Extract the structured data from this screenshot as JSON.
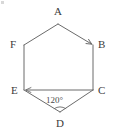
{
  "figure": {
    "type": "geometry-diagram",
    "shape_name": "hexagon",
    "stroke_color": "#6b6b6b",
    "label_color": "#3b3b3b",
    "background_color": "#ffffff",
    "vertices": [
      {
        "id": "A",
        "label": "A",
        "x": 58,
        "y": 24,
        "label_x": 54,
        "label_y": 6
      },
      {
        "id": "B",
        "label": "B",
        "x": 93,
        "y": 45,
        "label_x": 98,
        "label_y": 39
      },
      {
        "id": "C",
        "label": "C",
        "x": 93,
        "y": 90,
        "label_x": 98,
        "label_y": 85
      },
      {
        "id": "D",
        "label": "D",
        "x": 60,
        "y": 112,
        "label_x": 56,
        "label_y": 118
      },
      {
        "id": "E",
        "label": "E",
        "x": 24,
        "y": 90,
        "label_x": 11,
        "label_y": 85
      },
      {
        "id": "F",
        "label": "F",
        "x": 24,
        "y": 45,
        "label_x": 10,
        "label_y": 39
      }
    ],
    "edges": [
      {
        "from": "A",
        "to": "B",
        "arrow": "end"
      },
      {
        "from": "B",
        "to": "C",
        "arrow": "none"
      },
      {
        "from": "C",
        "to": "D",
        "arrow": "none"
      },
      {
        "from": "D",
        "to": "E",
        "arrow": "none"
      },
      {
        "from": "E",
        "to": "F",
        "arrow": "none"
      },
      {
        "from": "F",
        "to": "A",
        "arrow": "none"
      },
      {
        "from": "C",
        "to": "E",
        "arrow": "end"
      }
    ],
    "angles": [
      {
        "at": "D",
        "value": "120",
        "unit": "°",
        "label": "120°",
        "label_x": 46,
        "label_y": 96
      }
    ]
  }
}
